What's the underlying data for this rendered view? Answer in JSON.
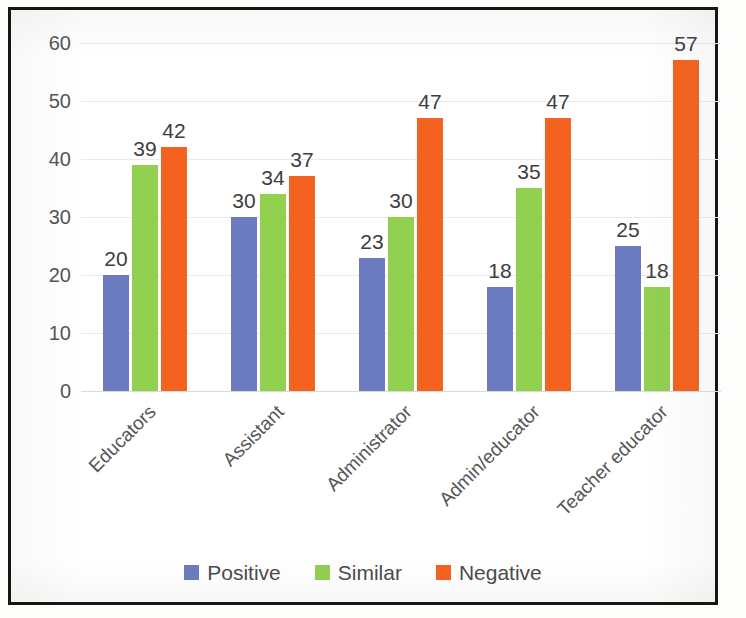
{
  "chart_data": {
    "type": "bar",
    "title": "",
    "subtitle": "",
    "xlabel": "",
    "ylabel": "",
    "categories": [
      "Educators",
      "Assistant",
      "Administrator",
      "Admin/educator",
      "Teacher educator"
    ],
    "series": [
      {
        "name": "Positive",
        "color": "#6c7bc0",
        "values": [
          20,
          30,
          23,
          18,
          25
        ]
      },
      {
        "name": "Similar",
        "color": "#92d050",
        "values": [
          39,
          34,
          30,
          35,
          18
        ]
      },
      {
        "name": "Negative",
        "color": "#f4621f",
        "values": [
          42,
          37,
          47,
          47,
          57
        ]
      }
    ],
    "ylim": [
      0,
      60
    ],
    "yticks": [
      0,
      10,
      20,
      30,
      40,
      50,
      60
    ],
    "ytick_labels": [
      "0",
      "10",
      "20",
      "30",
      "40",
      "50",
      "60"
    ],
    "grid": true,
    "grid_axis": "y",
    "legend_position": "bottom",
    "data_labels": true,
    "xtick_rotation": -45
  },
  "figure": {
    "border_color": "#191512",
    "background": "#ffffff",
    "gridline_color": "#e9e9ee",
    "text_color": "#545454"
  },
  "legend": {
    "items": [
      {
        "label": "Positive",
        "color": "#6c7bc0"
      },
      {
        "label": "Similar",
        "color": "#92d050"
      },
      {
        "label": "Negative",
        "color": "#f4621f"
      }
    ]
  }
}
